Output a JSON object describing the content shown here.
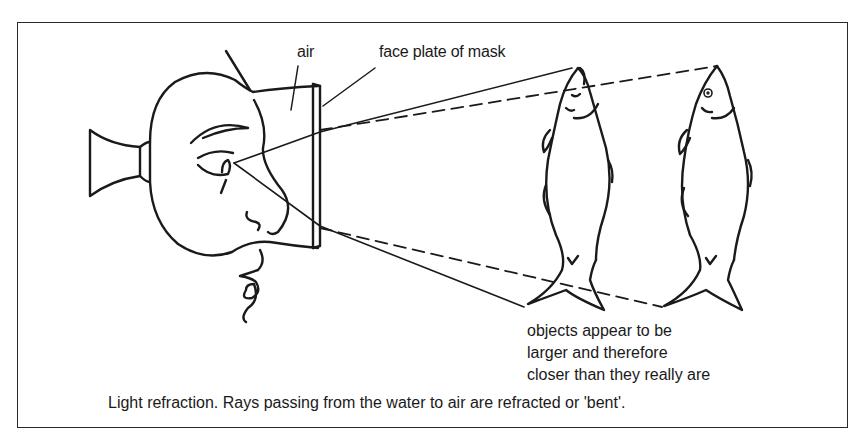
{
  "figure": {
    "labels": {
      "air": "air",
      "face_plate": "face plate of mask"
    },
    "note_lines": [
      "objects appear to be",
      "larger and therefore",
      "closer than they really are"
    ],
    "caption": "Light refraction. Rays passing from the water to air are refracted or 'bent'.",
    "elements": {
      "diver_head": "diver-with-mask",
      "real_fish": "fish (actual position)",
      "apparent_fish": "fish (apparent position)",
      "solid_rays": "actual light rays",
      "dashed_rays": "apparent light rays"
    },
    "colors": {
      "ink": "#1a1a1a",
      "background": "#ffffff"
    }
  }
}
